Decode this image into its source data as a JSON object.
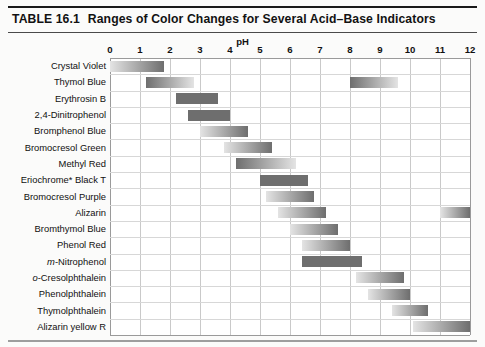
{
  "table": {
    "number_label": "TABLE 16.1",
    "title": "Ranges of Color Changes for Several Acid–Base Indicators",
    "axis_title": "pH"
  },
  "chart_data": {
    "type": "bar",
    "orientation": "horizontal-range",
    "title": "TABLE 16.1  Ranges of Color Changes for Several Acid–Base Indicators",
    "xlabel": "pH",
    "ylabel": "",
    "xlim": [
      0,
      12
    ],
    "xticks": [
      "0",
      "1",
      "2",
      "3",
      "4",
      "5",
      "6",
      "7",
      "8",
      "9",
      "10",
      "11",
      "12"
    ],
    "grid": true,
    "legend": "none",
    "categories": [
      "Crystal Violet",
      "Thymol Blue",
      "Erythrosin B",
      "2,4-Dinitrophenol",
      "Bromphenol Blue",
      "Bromocresol Green",
      "Methyl Red",
      "Eriochrome* Black T",
      "Bromocresol Purple",
      "Alizarin",
      "Bromthymol Blue",
      "Phenol Red",
      "m-Nitrophenol",
      "o-Cresolphthalein",
      "Phenolphthalein",
      "Thymolphthalein",
      "Alizarin yellow R"
    ],
    "series": [
      {
        "name": "pH transition range",
        "bars": [
          {
            "label": "Crystal Violet",
            "ranges": [
              [
                0.0,
                1.8
              ]
            ],
            "gradient": "light-to-dark"
          },
          {
            "label": "Thymol Blue",
            "ranges": [
              [
                1.2,
                2.8
              ],
              [
                8.0,
                9.6
              ]
            ],
            "gradient": "dark-to-light"
          },
          {
            "label": "Erythrosin B",
            "ranges": [
              [
                2.2,
                3.6
              ]
            ],
            "gradient": "flat"
          },
          {
            "label": "2,4-Dinitrophenol",
            "ranges": [
              [
                2.6,
                4.0
              ]
            ],
            "gradient": "flat"
          },
          {
            "label": "Bromphenol Blue",
            "ranges": [
              [
                3.0,
                4.6
              ]
            ],
            "gradient": "light-to-dark"
          },
          {
            "label": "Bromocresol Green",
            "ranges": [
              [
                3.8,
                5.4
              ]
            ],
            "gradient": "light-to-dark"
          },
          {
            "label": "Methyl Red",
            "ranges": [
              [
                4.2,
                6.2
              ]
            ],
            "gradient": "dark-to-light"
          },
          {
            "label": "Eriochrome* Black T",
            "ranges": [
              [
                5.0,
                6.6
              ]
            ],
            "gradient": "flat"
          },
          {
            "label": "Bromocresol Purple",
            "ranges": [
              [
                5.2,
                6.8
              ]
            ],
            "gradient": "light-to-dark"
          },
          {
            "label": "Alizarin",
            "ranges": [
              [
                5.6,
                7.2
              ],
              [
                11.0,
                12.4
              ]
            ],
            "gradient": "light-to-dark"
          },
          {
            "label": "Bromthymol Blue",
            "ranges": [
              [
                6.0,
                7.6
              ]
            ],
            "gradient": "light-to-dark"
          },
          {
            "label": "Phenol Red",
            "ranges": [
              [
                6.4,
                8.0
              ]
            ],
            "gradient": "light-to-dark"
          },
          {
            "label": "m-Nitrophenol",
            "ranges": [
              [
                6.4,
                8.4
              ]
            ],
            "gradient": "flat"
          },
          {
            "label": "o-Cresolphthalein",
            "ranges": [
              [
                8.2,
                9.8
              ]
            ],
            "gradient": "light-to-dark"
          },
          {
            "label": "Phenolphthalein",
            "ranges": [
              [
                8.6,
                10.0
              ]
            ],
            "gradient": "light-to-dark"
          },
          {
            "label": "Thymolphthalein",
            "ranges": [
              [
                9.4,
                10.6
              ]
            ],
            "gradient": "light-to-dark"
          },
          {
            "label": "Alizarin yellow R",
            "ranges": [
              [
                10.1,
                12.4
              ]
            ],
            "gradient": "light-to-dark"
          }
        ]
      }
    ]
  },
  "rows": [
    {
      "label": "Crystal Violet",
      "italic_prefix": ""
    },
    {
      "label": "Thymol Blue",
      "italic_prefix": ""
    },
    {
      "label": "Erythrosin B",
      "italic_prefix": ""
    },
    {
      "label": "2,4-Dinitrophenol",
      "italic_prefix": ""
    },
    {
      "label": "Bromphenol Blue",
      "italic_prefix": ""
    },
    {
      "label": "Bromocresol Green",
      "italic_prefix": ""
    },
    {
      "label": "Methyl Red",
      "italic_prefix": ""
    },
    {
      "label": "Eriochrome* Black T",
      "italic_prefix": ""
    },
    {
      "label": "Bromocresol Purple",
      "italic_prefix": ""
    },
    {
      "label": "Alizarin",
      "italic_prefix": ""
    },
    {
      "label": "Bromthymol Blue",
      "italic_prefix": ""
    },
    {
      "label": "Phenol Red",
      "italic_prefix": ""
    },
    {
      "label": "-Nitrophenol",
      "italic_prefix": "m"
    },
    {
      "label": "-Cresolphthalein",
      "italic_prefix": "o"
    },
    {
      "label": "Phenolphthalein",
      "italic_prefix": ""
    },
    {
      "label": "Thymolphthalein",
      "italic_prefix": ""
    },
    {
      "label": "Alizarin yellow R",
      "italic_prefix": ""
    }
  ],
  "colors": {
    "bar_dark": "#6e6e6e",
    "bar_light": "#e4e4e4",
    "grid": "#c9c9c9",
    "text": "#101010",
    "page_bg": "#fbfbfa"
  }
}
